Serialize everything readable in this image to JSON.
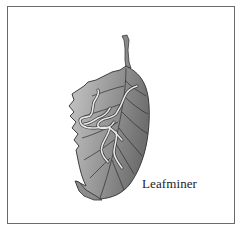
{
  "figure": {
    "caption": "Leafminer",
    "colors": {
      "frame": "#6a6a6a",
      "leaf_light": "#c4c4c4",
      "leaf_dark": "#7a7a7a",
      "veins": "#3a3a3a",
      "mines": "#e6e6e6"
    }
  }
}
